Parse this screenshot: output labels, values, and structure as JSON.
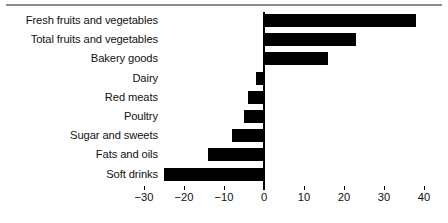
{
  "chart_data": {
    "type": "bar",
    "orientation": "horizontal",
    "title": "",
    "subtitle": "",
    "xlabel": "",
    "ylabel": "",
    "categories": [
      "Fresh fruits and vegetables",
      "Total fruits and vegetables",
      "Bakery goods",
      "Dairy",
      "Red meats",
      "Poultry",
      "Sugar and sweets",
      "Fats and oils",
      "Soft drinks"
    ],
    "values": [
      38,
      23,
      16,
      -2,
      -4,
      -5,
      -8,
      -14,
      -25
    ],
    "xlim": [
      -30,
      40
    ],
    "xticks": [
      -30,
      -20,
      -10,
      0,
      10,
      20,
      30,
      40
    ],
    "xtick_labels": [
      "−30",
      "−20",
      "−10",
      "0",
      "10",
      "20",
      "30",
      "40"
    ],
    "grid": false,
    "legend": false,
    "bar_color": "#000000",
    "axis_color": "#000000",
    "rule_color": "#8c8c8c",
    "text_color": "#121212"
  }
}
